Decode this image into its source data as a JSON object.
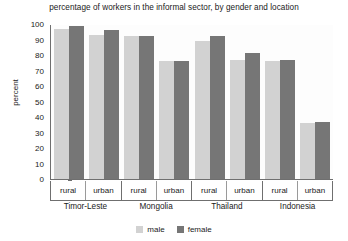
{
  "chart_data": {
    "type": "bar",
    "title": "percentage of workers in the informal sector, by gender and location",
    "xlabel": "",
    "ylabel": "percent",
    "ylim": [
      0,
      100
    ],
    "ytick_step": 10,
    "yticks": [
      100,
      90,
      80,
      70,
      60,
      50,
      40,
      30,
      20,
      10,
      0
    ],
    "grid": false,
    "legend_position": "bottom-center",
    "groups": [
      "Timor-Leste",
      "Mongolia",
      "Thailand",
      "Indonesia"
    ],
    "subcategories": [
      "rural",
      "urban"
    ],
    "categories": [
      "Timor-Leste rural",
      "Timor-Leste urban",
      "Mongolia rural",
      "Mongolia urban",
      "Thailand rural",
      "Thailand urban",
      "Indonesia rural",
      "Indonesia urban"
    ],
    "series": [
      {
        "name": "male",
        "color": "#d2d2d2",
        "values": [
          97,
          93,
          92,
          76,
          89,
          77,
          76,
          36
        ]
      },
      {
        "name": "female",
        "color": "#767676",
        "values": [
          99,
          96,
          92,
          76,
          92,
          81,
          77,
          37
        ]
      }
    ]
  },
  "legend": {
    "items": [
      {
        "label": "male"
      },
      {
        "label": "female"
      }
    ]
  },
  "axis": {
    "groups": [
      {
        "name": "Timor-Leste",
        "cells": [
          "rural",
          "urban"
        ]
      },
      {
        "name": "Mongolia",
        "cells": [
          "rural",
          "urban"
        ]
      },
      {
        "name": "Thailand",
        "cells": [
          "rural",
          "urban"
        ]
      },
      {
        "name": "Indonesia",
        "cells": [
          "rural",
          "urban"
        ]
      }
    ]
  }
}
